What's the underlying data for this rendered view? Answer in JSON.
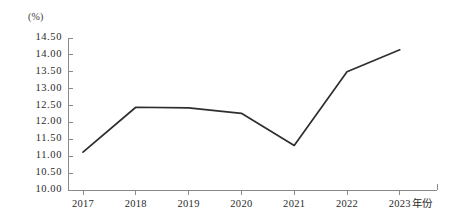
{
  "chart_data": {
    "type": "line",
    "title": "",
    "xlabel": "年份",
    "ylabel": "(%)",
    "categories": [
      "2017",
      "2018",
      "2019",
      "2020",
      "2021",
      "2022",
      "2023"
    ],
    "values": [
      11.12,
      12.45,
      12.43,
      12.27,
      11.32,
      13.5,
      14.15
    ],
    "series": [
      {
        "name": "",
        "values": [
          11.12,
          12.45,
          12.43,
          12.27,
          11.32,
          13.5,
          14.15
        ]
      }
    ],
    "ylim": [
      10.0,
      14.5
    ],
    "ytick_labels": [
      "14.50",
      "14.00",
      "13.50",
      "13.00",
      "12.50",
      "12.00",
      "11.50",
      "11.00",
      "10.50",
      "10.00"
    ],
    "ytick_values": [
      14.5,
      14.0,
      13.5,
      13.0,
      12.5,
      12.0,
      11.5,
      11.0,
      10.5,
      10.0
    ],
    "grid": false,
    "legend": false,
    "legend_position": "none",
    "line_color": "#2e2e2e",
    "axis_color": "#8a8a8a",
    "markers": false
  }
}
